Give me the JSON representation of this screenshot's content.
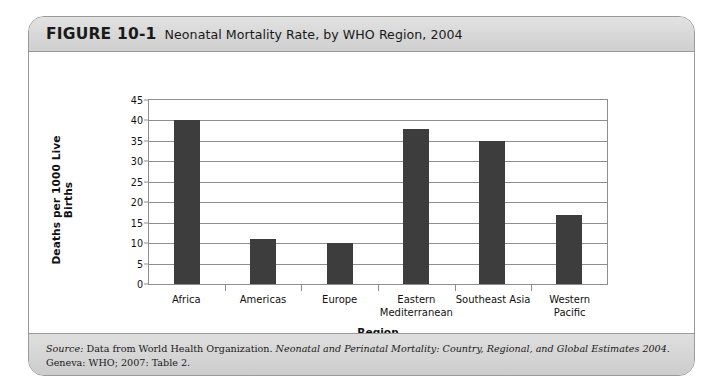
{
  "figure": {
    "number": "FIGURE 10-1",
    "title": "Neonatal Mortality Rate, by WHO Region, 2004",
    "source_label": "Source:",
    "source_text_1": " Data from World Health Organization. ",
    "source_title": "Neonatal and Perinatal Mortality: Country, Regional, and Global Estimates 2004",
    "source_text_2": ". Geneva: WHO; 2007: Table 2."
  },
  "chart_data": {
    "type": "bar",
    "title": "Neonatal Mortality Rate, by WHO Region, 2004",
    "xlabel": "Region",
    "ylabel": "Deaths per 1000 Live Births",
    "ylim": [
      0,
      45
    ],
    "ytick_step": 5,
    "yticks": [
      0,
      5,
      10,
      15,
      20,
      25,
      30,
      35,
      40,
      45
    ],
    "ytick_labels": [
      "0",
      "5",
      "10",
      "15",
      "20",
      "25",
      "30",
      "35",
      "40",
      "45"
    ],
    "grid": true,
    "legend": "none",
    "bar_color": "#3d3d3d",
    "categories": [
      "Africa",
      "Americas",
      "Europe",
      "Eastern Mediterranean",
      "Southeast Asia",
      "Western Pacific"
    ],
    "values": [
      40,
      11,
      10,
      38,
      35,
      17
    ]
  }
}
